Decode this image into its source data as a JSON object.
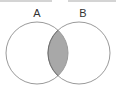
{
  "diagram": {
    "type": "venn",
    "sets": [
      {
        "label": "A",
        "cx": 37,
        "cy": 53,
        "r": 31
      },
      {
        "label": "B",
        "cx": 79,
        "cy": 53,
        "r": 31
      }
    ],
    "highlighted_region": "A ∩ B",
    "colors": {
      "stroke": "#9a9a9a",
      "intersection_fill": "#a8a8a8",
      "intersection_stroke": "#6e6e6e",
      "label": "#333333",
      "background": "#ffffff"
    }
  }
}
